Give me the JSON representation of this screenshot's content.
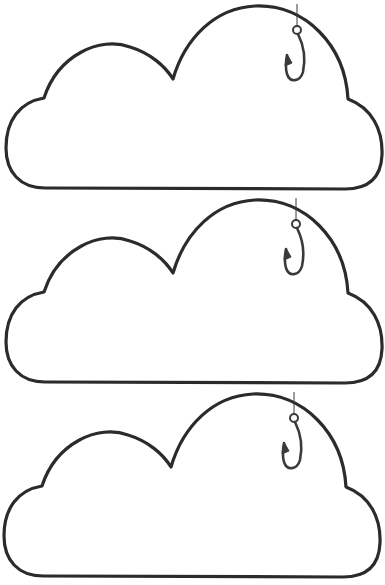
{
  "page": {
    "background": "#ffffff",
    "stroke_color": "#2b2b2b"
  },
  "clouds": [
    {
      "id": 1,
      "top": 0,
      "icon": "cloud-icon",
      "hook_icon": "fishing-hook-icon"
    },
    {
      "id": 2,
      "top": 194,
      "icon": "cloud-icon",
      "hook_icon": "fishing-hook-icon"
    },
    {
      "id": 3,
      "top": 388,
      "icon": "cloud-icon",
      "hook_icon": "fishing-hook-icon"
    }
  ]
}
